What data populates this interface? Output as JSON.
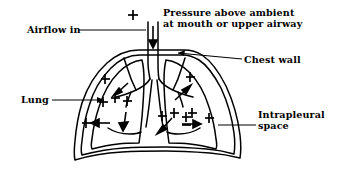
{
  "figure": {
    "background_color": "#ffffff",
    "stroke_color": "#000000",
    "labels": {
      "airflow_in": "Airflow in",
      "pressure_line1": "Pressure above ambient",
      "pressure_line2": "at mouth or upper airway",
      "chest_wall": "Chest wall",
      "lung": "Lung",
      "intrapleural_line1": "Intrapleural",
      "intrapleural_line2": "space"
    },
    "symbols": {
      "plus": "+",
      "plus_minus": "±"
    },
    "annotations": {
      "plus_signs_count": 11,
      "plus_minus_signs_count": 1,
      "arrows_count": 8,
      "airway_arrow_direction": "down",
      "intrapleural_arrows": "inward toward lungs",
      "description": "Schematic coronal section of the thorax showing lungs, trachea and bronchi, chest wall outline, and intrapleural space, with plus signs marking pressure above ambient and arrows marking airflow and force directions."
    }
  }
}
